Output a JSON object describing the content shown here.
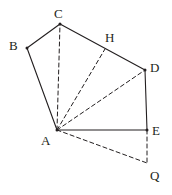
{
  "figure": {
    "background_color": "#ffffff",
    "stroke_color": "#231f20",
    "label_color": "#231f20",
    "solid_stroke_width": 1.1,
    "dashed_stroke_width": 1.0,
    "dash_pattern": "4,3",
    "width": 172,
    "height": 195
  },
  "points": {
    "A": {
      "label": "A",
      "x": 57,
      "y": 130,
      "label_x": 41,
      "label_y": 134
    },
    "B": {
      "label": "B",
      "x": 27,
      "y": 48,
      "label_x": 9,
      "label_y": 39
    },
    "C": {
      "label": "C",
      "x": 60,
      "y": 24,
      "label_x": 54,
      "label_y": 7
    },
    "D": {
      "label": "D",
      "x": 145,
      "y": 70,
      "label_x": 150,
      "label_y": 61
    },
    "E": {
      "label": "E",
      "x": 147,
      "y": 130,
      "label_x": 152,
      "label_y": 124
    },
    "H": {
      "label": "H",
      "x": 105,
      "y": 49,
      "label_x": 105,
      "label_y": 31
    },
    "Q": {
      "label": "Q",
      "x": 147,
      "y": 163,
      "label_x": 150,
      "label_y": 169
    }
  },
  "solid_edges": [
    {
      "name": "edge-A-B",
      "from": "A",
      "to": "B"
    },
    {
      "name": "edge-B-C",
      "from": "B",
      "to": "C"
    },
    {
      "name": "edge-C-D",
      "from": "C",
      "to": "D"
    },
    {
      "name": "edge-D-E",
      "from": "D",
      "to": "E"
    },
    {
      "name": "edge-A-E",
      "from": "A",
      "to": "E"
    }
  ],
  "dashed_edges": [
    {
      "name": "edge-A-C",
      "from": "A",
      "to": "C"
    },
    {
      "name": "edge-A-H",
      "from": "A",
      "to": "H"
    },
    {
      "name": "edge-A-D",
      "from": "A",
      "to": "D"
    },
    {
      "name": "edge-A-Q",
      "from": "A",
      "to": "Q"
    },
    {
      "name": "edge-E-Q",
      "from": "E",
      "to": "Q"
    }
  ],
  "vertex_dots": [
    "A",
    "C",
    "D",
    "E",
    "B"
  ]
}
